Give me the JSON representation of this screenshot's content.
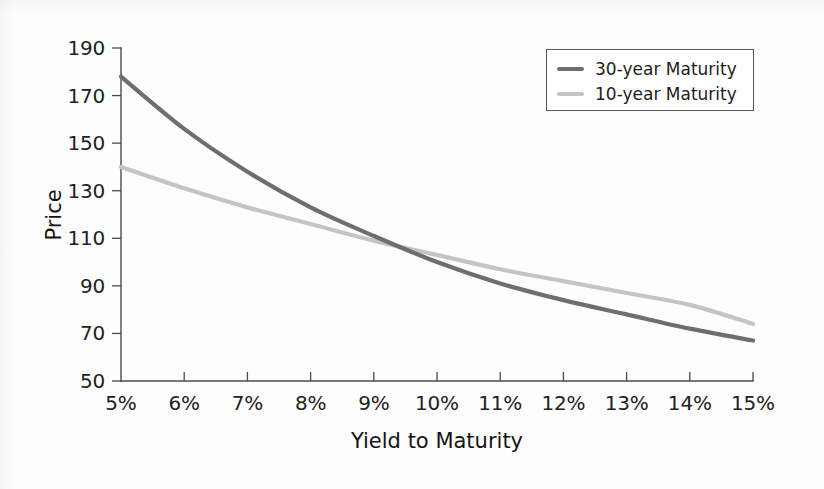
{
  "chart_data": {
    "type": "line",
    "title": "",
    "subtitle": "",
    "xlabel": "Yield to Maturity",
    "ylabel": "Price",
    "xlim": [
      5,
      15
    ],
    "ylim": [
      50,
      190
    ],
    "xticks": [
      5,
      6,
      7,
      8,
      9,
      10,
      11,
      12,
      13,
      14,
      15
    ],
    "xticklabels": [
      "5%",
      "6%",
      "7%",
      "8%",
      "9%",
      "10%",
      "11%",
      "12%",
      "13%",
      "14%",
      "15%"
    ],
    "yticks": [
      50,
      70,
      90,
      110,
      130,
      150,
      170,
      190
    ],
    "yticklabels": [
      "50",
      "70",
      "90",
      "110",
      "130",
      "150",
      "170",
      "190"
    ],
    "grid": false,
    "legend_position": "top-right",
    "x": [
      5,
      6,
      7,
      8,
      9,
      10,
      11,
      12,
      13,
      14,
      15
    ],
    "series": [
      {
        "name": "30-year Maturity",
        "color": "#6e6e6e",
        "linewidth": 4.2,
        "values": [
          178,
          156,
          138,
          123,
          111,
          100,
          91,
          84,
          78,
          72,
          67
        ]
      },
      {
        "name": "10-year Maturity",
        "color": "#c4c4c4",
        "linewidth": 4.2,
        "values": [
          140,
          131,
          123,
          116,
          109,
          103,
          97,
          92,
          87,
          82,
          74
        ]
      }
    ],
    "annotations": []
  },
  "legend": {
    "entries": [
      {
        "label": "30-year Maturity",
        "swatch_color": "#6e6e6e"
      },
      {
        "label": "10-year Maturity",
        "swatch_color": "#c4c4c4"
      }
    ]
  },
  "colors": {
    "axis": "#4a4a4a",
    "text": "#1d1d1d",
    "background": "#fdfdfd",
    "legend_border": "#585858"
  }
}
